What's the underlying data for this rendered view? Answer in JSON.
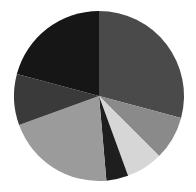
{
  "chart_data": {
    "type": "pie",
    "title": "",
    "xlabel": "",
    "ylabel": "",
    "grid": false,
    "legend_position": "none",
    "background_color": "#ffffff",
    "center_x": 99,
    "center_y": 96,
    "radius": 85,
    "start_angle_deg": 0,
    "direction": "clockwise",
    "labels": [
      "Slice 1",
      "Slice 2",
      "Slice 3",
      "Slice 4",
      "Slice 5",
      "Slice 6",
      "Slice 7"
    ],
    "values": [
      29.2,
      8.3,
      6.9,
      4.2,
      20.8,
      9.7,
      20.9
    ],
    "angles_deg": [
      105,
      30,
      25,
      15,
      75,
      35,
      75
    ],
    "colors": [
      "#4a4a4a",
      "#8a8a8a",
      "#d6d6d6",
      "#1e1e1e",
      "#9b9b9b",
      "#3a3a3a",
      "#161616"
    ],
    "slices": [
      {
        "label": "Slice 1",
        "value": 29.2,
        "angle_deg": 105,
        "color": "#4a4a4a"
      },
      {
        "label": "Slice 2",
        "value": 8.3,
        "angle_deg": 30,
        "color": "#8a8a8a"
      },
      {
        "label": "Slice 3",
        "value": 6.9,
        "angle_deg": 25,
        "color": "#d6d6d6"
      },
      {
        "label": "Slice 4",
        "value": 4.2,
        "angle_deg": 15,
        "color": "#1e1e1e"
      },
      {
        "label": "Slice 5",
        "value": 20.8,
        "angle_deg": 75,
        "color": "#9b9b9b"
      },
      {
        "label": "Slice 6",
        "value": 9.7,
        "angle_deg": 35,
        "color": "#3a3a3a"
      },
      {
        "label": "Slice 7",
        "value": 20.9,
        "angle_deg": 75,
        "color": "#161616"
      }
    ]
  }
}
